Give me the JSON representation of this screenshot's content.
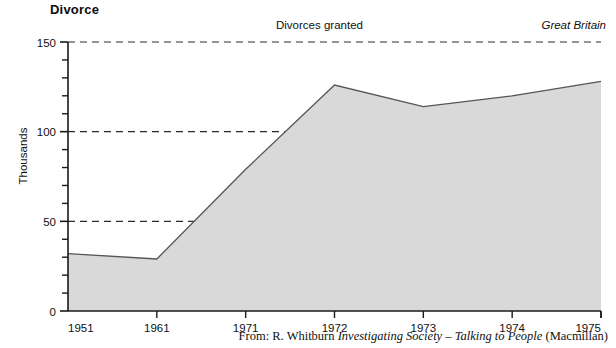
{
  "chart_data": {
    "type": "area",
    "title": "Divorce",
    "series_annotation": "Divorces granted",
    "region_annotation": "Great Britain",
    "xlabel": "",
    "ylabel": "Thousands",
    "x": [
      1951,
      1961,
      1971,
      1972,
      1973,
      1974,
      1975
    ],
    "x_tick_labels": [
      "1951",
      "1961",
      "1971",
      "1972",
      "1973",
      "1974",
      "1975"
    ],
    "values": [
      32,
      29,
      79,
      126,
      114,
      120,
      128
    ],
    "y_tick_labels": [
      "0",
      "50",
      "100",
      "150"
    ],
    "y_major_ticks": [
      0,
      50,
      100,
      150
    ],
    "y_minor_tick_step": 10,
    "ylim": [
      0,
      150
    ],
    "xlim": [
      1951,
      1975
    ],
    "grid": "dashed-horizontal-at-major-y",
    "legend": "none",
    "fill_color": "#d9d9d9",
    "line_color": "#555555",
    "axis_color": "#1a1a1a",
    "gridline_color": "#2b2b2b"
  },
  "source": {
    "prefix": "From: R. Whitburn ",
    "work_title": "Investigating Society – Talking to People",
    "publisher": " (Macmillan)"
  }
}
